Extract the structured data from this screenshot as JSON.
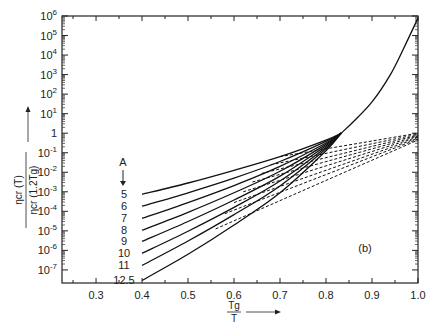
{
  "chart_data": {
    "type": "line",
    "title": "",
    "panel_label": "(b)",
    "xlabel": "Tg / T",
    "ylabel": "η_cr(T) / η_cr(1.2Tg)",
    "xlim": [
      0.226,
      1.0
    ],
    "ylim_log10": [
      -7.67,
      6
    ],
    "y_scale": "log",
    "grid": false,
    "x_ticks": [
      0.3,
      0.4,
      0.5,
      0.6,
      0.7,
      0.8,
      0.9,
      1.0
    ],
    "x_tick_labels": [
      "0.3",
      "0.4",
      "0.5",
      "0.6",
      "0.7",
      "0.8",
      "0.9",
      "1.0"
    ],
    "y_ticks_log10": [
      6,
      5,
      4,
      3,
      2,
      1,
      0,
      -1,
      -2,
      -3,
      -4,
      -5,
      -6,
      -7
    ],
    "y_tick_labels": [
      "10^6",
      "10^5",
      "10^4",
      "10^3",
      "10^2",
      "10^1",
      "1",
      "10^-1",
      "10^-2",
      "10^-3",
      "10^-4",
      "10^-5",
      "10^-6",
      "10^-7"
    ],
    "legend": {
      "title": "A",
      "entries": [
        "5",
        "6",
        "7",
        "8",
        "9",
        "10",
        "11",
        "12.5"
      ]
    },
    "series": [
      {
        "name": "A=5",
        "style": "solid",
        "x": [
          0.4,
          0.5,
          0.6,
          0.7,
          0.8,
          0.833
        ],
        "log10_y": [
          -3.13,
          -2.55,
          -1.9,
          -1.2,
          -0.35,
          0
        ]
      },
      {
        "name": "A=6",
        "style": "solid",
        "x": [
          0.4,
          0.5,
          0.6,
          0.7,
          0.8,
          0.833
        ],
        "log10_y": [
          -3.74,
          -3.05,
          -2.3,
          -1.45,
          -0.42,
          0
        ]
      },
      {
        "name": "A=7",
        "style": "solid",
        "x": [
          0.4,
          0.5,
          0.6,
          0.7,
          0.8,
          0.833
        ],
        "log10_y": [
          -4.36,
          -3.55,
          -2.68,
          -1.7,
          -0.5,
          0
        ]
      },
      {
        "name": "A=8",
        "style": "solid",
        "x": [
          0.4,
          0.5,
          0.6,
          0.7,
          0.8,
          0.833
        ],
        "log10_y": [
          -4.97,
          -4.05,
          -3.05,
          -1.95,
          -0.57,
          0
        ]
      },
      {
        "name": "A=9",
        "style": "solid",
        "x": [
          0.4,
          0.5,
          0.6,
          0.7,
          0.8,
          0.833
        ],
        "log10_y": [
          -5.54,
          -4.52,
          -3.42,
          -2.2,
          -0.64,
          0
        ]
      },
      {
        "name": "A=10",
        "style": "solid",
        "x": [
          0.4,
          0.5,
          0.6,
          0.7,
          0.8,
          0.833
        ],
        "log10_y": [
          -6.15,
          -5.02,
          -3.8,
          -2.45,
          -0.72,
          0
        ]
      },
      {
        "name": "A=11",
        "style": "solid",
        "x": [
          0.4,
          0.5,
          0.6,
          0.7,
          0.8,
          0.833
        ],
        "log10_y": [
          -6.77,
          -5.52,
          -4.17,
          -2.7,
          -0.8,
          0
        ]
      },
      {
        "name": "A=12.5",
        "style": "solid",
        "x": [
          0.4,
          0.5,
          0.6,
          0.7,
          0.8,
          0.833
        ],
        "log10_y": [
          -7.54,
          -6.2,
          -4.7,
          -3.05,
          -0.9,
          0
        ]
      },
      {
        "name": "upper (common)",
        "style": "solid",
        "x": [
          0.833,
          0.86,
          0.9,
          0.94,
          0.97,
          1.0
        ],
        "log10_y": [
          0,
          0.6,
          1.6,
          3.0,
          4.4,
          5.9
        ]
      },
      {
        "name": "A=5 dashed",
        "style": "dashed",
        "x": [
          0.7,
          1.0
        ],
        "log10_y": [
          -1.2,
          0
        ]
      },
      {
        "name": "A=6 dashed",
        "style": "dashed",
        "x": [
          0.68,
          1.0
        ],
        "log10_y": [
          -1.62,
          -0.05
        ]
      },
      {
        "name": "A=7 dashed",
        "style": "dashed",
        "x": [
          0.66,
          1.0
        ],
        "log10_y": [
          -2.06,
          -0.1
        ]
      },
      {
        "name": "A=8 dashed",
        "style": "dashed",
        "x": [
          0.64,
          1.0
        ],
        "log10_y": [
          -2.5,
          -0.15
        ]
      },
      {
        "name": "A=9 dashed",
        "style": "dashed",
        "x": [
          0.62,
          1.0
        ],
        "log10_y": [
          -3.0,
          -0.2
        ]
      },
      {
        "name": "A=10 dashed",
        "style": "dashed",
        "x": [
          0.6,
          1.0
        ],
        "log10_y": [
          -3.55,
          -0.25
        ]
      },
      {
        "name": "A=11 dashed",
        "style": "dashed",
        "x": [
          0.58,
          1.0
        ],
        "log10_y": [
          -4.12,
          -0.3
        ]
      },
      {
        "name": "A=12.5 dashed",
        "style": "dashed",
        "x": [
          0.56,
          1.0
        ],
        "log10_y": [
          -4.9,
          -0.35
        ]
      }
    ],
    "annotations": [
      "A ↓ (arrow indicating increasing A)",
      "(b)"
    ]
  }
}
